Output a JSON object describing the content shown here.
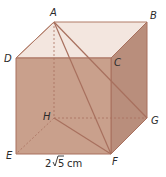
{
  "vertices": {
    "A": {
      "label": "A"
    },
    "B": {
      "label": "B"
    },
    "C": {
      "label": "C"
    },
    "D": {
      "label": "D"
    },
    "E": {
      "label": "E"
    },
    "F": {
      "label": "F"
    },
    "G": {
      "label": "G"
    },
    "H": {
      "label": "H"
    }
  },
  "dimension_label": {
    "coefficient": "2",
    "radicand": "5",
    "unit": "cm"
  },
  "colors": {
    "front_face": "#c9a08c",
    "right_face": "#b98e7c",
    "top_face": "#f3e6df",
    "edge": "#a8705e",
    "hidden_edge": "#a8705e"
  },
  "segments": [
    "AF",
    "AG",
    "HF",
    "AH (hidden)",
    "HE (hidden)",
    "HG (hidden)"
  ]
}
